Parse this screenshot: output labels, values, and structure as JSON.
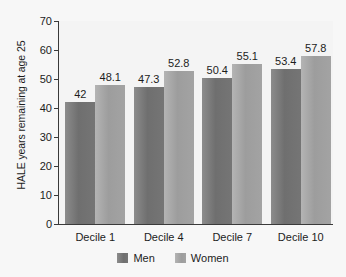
{
  "chart_data": {
    "type": "bar",
    "title": "",
    "xlabel": "",
    "ylabel": "HALE years remaining at age 25",
    "categories": [
      "Decile 1",
      "Decile 4",
      "Decile 7",
      "Decile 10"
    ],
    "series": [
      {
        "name": "Men",
        "color": "#757575",
        "values": [
          42,
          47.3,
          50.4,
          53.4
        ],
        "labels": [
          "42",
          "47.3",
          "50.4",
          "53.4"
        ]
      },
      {
        "name": "Women",
        "color": "#a3a3a3",
        "values": [
          48.1,
          52.8,
          55.1,
          57.8
        ],
        "labels": [
          "48.1",
          "52.8",
          "55.1",
          "57.8"
        ]
      }
    ],
    "ylim": [
      0,
      70
    ],
    "yticks": [
      0,
      10,
      20,
      30,
      40,
      50,
      60,
      70
    ],
    "ytick_labels": [
      "0",
      "10",
      "20",
      "30",
      "40",
      "50",
      "60",
      "70"
    ],
    "grid": false,
    "legend_position": "bottom",
    "legend": [
      "Men",
      "Women"
    ]
  }
}
